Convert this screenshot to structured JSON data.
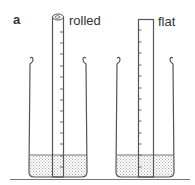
{
  "panel_label": "a",
  "columns": [
    {
      "id": "rolled",
      "label": "rolled"
    },
    {
      "id": "flat",
      "label": "flat"
    }
  ],
  "colors": {
    "stroke": "#555555",
    "fill_stipple": "#cccccc",
    "background": "#ffffff"
  }
}
